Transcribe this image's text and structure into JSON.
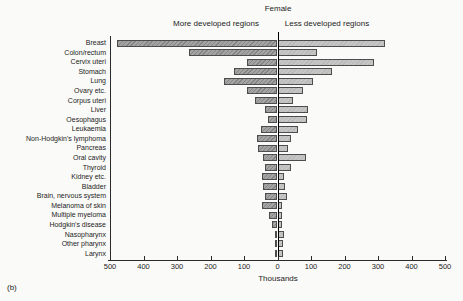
{
  "figure_label": "(b)",
  "chart_data": {
    "type": "bar",
    "orientation": "horizontal-diverging",
    "title": "Female",
    "left_header": "More developed regions",
    "right_header": "Less developed regions",
    "xlabel": "Thousands",
    "unit": "Thousands",
    "xlim": [
      -500,
      500
    ],
    "axis_tick_labels": [
      "500",
      "400",
      "300",
      "200",
      "100",
      "0",
      "100",
      "200",
      "300",
      "400",
      "500"
    ],
    "categories": [
      "Breast",
      "Colon/rectum",
      "Cervix uteri",
      "Stomach",
      "Lung",
      "Ovary etc.",
      "Corpus uteri",
      "Liver",
      "Oesophagus",
      "Leukaemia",
      "Non-Hodgkin's lymphoma",
      "Pancreas",
      "Oral cavity",
      "Thyroid",
      "Kidney etc.",
      "Bladder",
      "Brain, nervous system",
      "Melanoma of skin",
      "Multiple myeloma",
      "Hodgkin's disease",
      "Nasopharynx",
      "Other pharynx",
      "Larynx"
    ],
    "series": [
      {
        "name": "More developed regions",
        "side": "left",
        "values": [
          480,
          265,
          92,
          130,
          160,
          90,
          67,
          37,
          27,
          49,
          62,
          59,
          42,
          37,
          45,
          42,
          36,
          45,
          24,
          16,
          8,
          8,
          8
        ]
      },
      {
        "name": "Less developed regions",
        "side": "right",
        "values": [
          322,
          117,
          287,
          162,
          107,
          77,
          45,
          92,
          89,
          62,
          40,
          32,
          85,
          40,
          18,
          22,
          29,
          13,
          13,
          14,
          18,
          17,
          15
        ]
      }
    ],
    "colors": {
      "left_bar": "#a4a4a4",
      "right_bar": "#c6c6c6",
      "bar_border": "#4d4d4d",
      "axis": "#2a2a2a",
      "background": "#fafaf8"
    },
    "legend_position": "top",
    "grid": false
  }
}
